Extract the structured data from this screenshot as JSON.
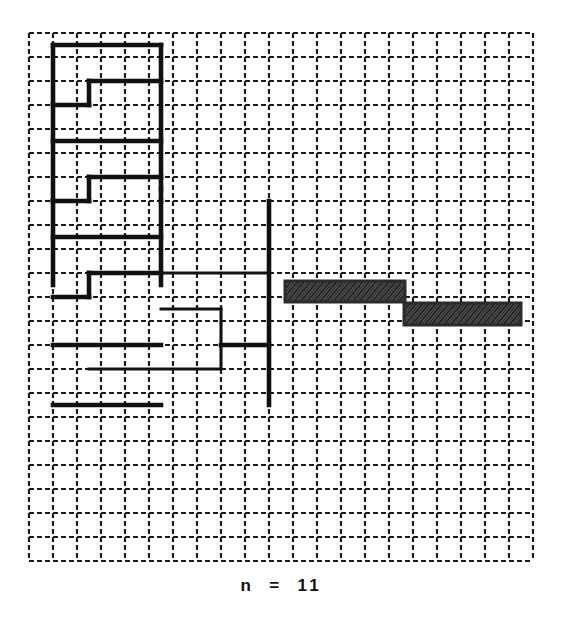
{
  "figure": {
    "title": "",
    "caption": "n  =  11",
    "caption_label": "n = 11",
    "background_color": "#ffffff",
    "grid": {
      "name": "dashed-lattice",
      "origin_x": 29,
      "origin_y": 33,
      "cell_size": 24,
      "cols": 21,
      "rows": 22,
      "line_color": "#1a1a1a",
      "line_width": 2.2,
      "dash_pattern": "5 3",
      "visible": true
    },
    "path": {
      "name": "serpentine-curve",
      "stroke_color": "#111111",
      "stroke_width": 4.6,
      "stroke_width_thin": 3.0,
      "description": "self-avoiding boustrophedon lattice path",
      "segments": [
        {
          "name": "top-outer-left-vertical",
          "x1": 2,
          "y1": 1,
          "x2": 2,
          "y2": 14,
          "weight": "thick"
        },
        {
          "name": "top-horizontal-run",
          "x1": 2,
          "y1": 1,
          "x2": 11,
          "y2": 1,
          "weight": "thick"
        },
        {
          "name": "spine-vertical-upper",
          "x1": 11,
          "y1": 1,
          "x2": 11,
          "y2": 13,
          "weight": "thick"
        },
        {
          "name": "step1-horizontal",
          "x1": 5,
          "y1": 4,
          "x2": 11,
          "y2": 4,
          "weight": "thick"
        },
        {
          "name": "step1-riser",
          "x1": 5,
          "y1": 4,
          "x2": 5,
          "y2": 6,
          "weight": "thick"
        },
        {
          "name": "step1-return",
          "x1": 2,
          "y1": 6,
          "x2": 5,
          "y2": 6,
          "weight": "thick"
        },
        {
          "name": "step2-horizontal",
          "x1": 2,
          "y1": 9,
          "x2": 11,
          "y2": 9,
          "weight": "thick"
        },
        {
          "name": "step3-horizontal",
          "x1": 5,
          "y1": 12,
          "x2": 11,
          "y2": 12,
          "weight": "thick"
        },
        {
          "name": "step3-riser",
          "x1": 5,
          "y1": 12,
          "x2": 5,
          "y2": 14,
          "weight": "thick"
        },
        {
          "name": "step3-return",
          "x1": 2,
          "y1": 14,
          "x2": 5,
          "y2": 14,
          "weight": "thick"
        },
        {
          "name": "left-outer-vertical-lower",
          "x1": 2,
          "y1": 14,
          "x2": 2,
          "y2": 21,
          "weight": "thick"
        },
        {
          "name": "mid-horizontal",
          "x1": 2,
          "y1": 17,
          "x2": 11,
          "y2": 17,
          "weight": "thick"
        },
        {
          "name": "spine-vertical-lower",
          "x1": 11,
          "y1": 14,
          "x2": 11,
          "y2": 21,
          "weight": "thick"
        },
        {
          "name": "step4-horizontal",
          "x1": 5,
          "y1": 20,
          "x2": 11,
          "y2": 20,
          "weight": "thick"
        },
        {
          "name": "step4-riser",
          "x1": 5,
          "y1": 20,
          "x2": 5,
          "y2": 22,
          "weight": "thick"
        },
        {
          "name": "step4-return",
          "x1": 2,
          "y1": 22,
          "x2": 5,
          "y2": 22,
          "weight": "thick"
        },
        {
          "name": "bottom-horizontal",
          "x1": 2,
          "y1": 26,
          "x2": 11,
          "y2": 26,
          "weight": "thick"
        },
        {
          "name": "bottom-outer",
          "x1": 2,
          "y1": 31,
          "x2": 11,
          "y2": 31,
          "weight": "thick"
        },
        {
          "name": "right-branch-top",
          "x1": 11,
          "y1": 20,
          "x2": 20,
          "y2": 20,
          "weight": "thin"
        },
        {
          "name": "right-outer-vertical",
          "x1": 20,
          "y1": 14,
          "x2": 20,
          "y2": 31,
          "weight": "thick"
        },
        {
          "name": "right-inner-box-top",
          "x1": 11,
          "y1": 23,
          "x2": 16,
          "y2": 23,
          "weight": "thin"
        },
        {
          "name": "right-inner-box-right",
          "x1": 16,
          "y1": 23,
          "x2": 16,
          "y2": 28,
          "weight": "thin"
        },
        {
          "name": "right-inner-box-bottom",
          "x1": 5,
          "y1": 28,
          "x2": 16,
          "y2": 28,
          "weight": "thin"
        },
        {
          "name": "right-lower-horizontal",
          "x1": 16,
          "y1": 26,
          "x2": 20,
          "y2": 26,
          "weight": "thick"
        },
        {
          "name": "shade-connector-vertical",
          "x1": 11,
          "y1": 13,
          "x2": 11,
          "y2": 14,
          "weight": "thick"
        }
      ]
    },
    "shaded_bars": [
      {
        "name": "shaded-bar-upper",
        "x": 285,
        "y": 281,
        "width": 120,
        "height": 21,
        "fill": "#2b2b2b",
        "pattern": "dense-hatch"
      },
      {
        "name": "shaded-bar-lower",
        "x": 404,
        "y": 303,
        "width": 117,
        "height": 22,
        "fill": "#2b2b2b",
        "pattern": "dense-hatch"
      }
    ]
  },
  "chart_data": {
    "type": "diagram",
    "title": "",
    "xlabel": "",
    "ylabel": "",
    "annotations": [
      "n = 11"
    ],
    "grid": true,
    "legend": "none"
  }
}
